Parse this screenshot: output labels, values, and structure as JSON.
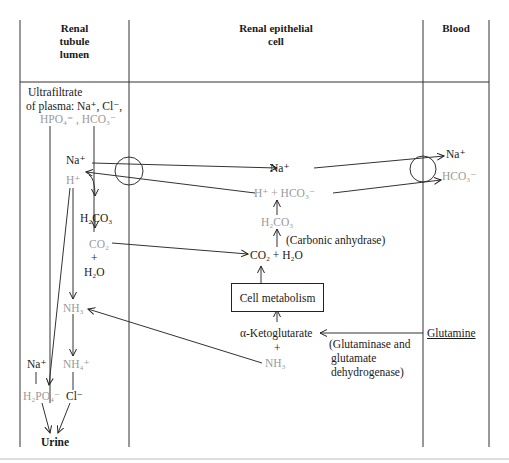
{
  "columns": {
    "lumen": {
      "line1": "Renal",
      "line2": "tubule",
      "line3": "lumen"
    },
    "cell": {
      "line1": "Renal epithelial",
      "line2": "cell"
    },
    "blood": {
      "line1": "Blood"
    }
  },
  "lumen": {
    "ultrafiltrate_line1": "Ultrafiltrate",
    "ultrafiltrate_line2": "of plasma: Na⁺, Cl⁻,",
    "ultrafiltrate_line3": "HPO₄⁼ , HCO₃⁻",
    "na": "Na⁺",
    "h": "H⁺",
    "h2co3": "H₂CO₃",
    "co2": "CO₂",
    "plus": "+",
    "h2o": "H₂O",
    "nh3": "NH₃",
    "na_lower": "Na⁺",
    "nh4": "NH₄⁺",
    "h2po4": "H₂PO₄⁻",
    "cl": "Cl⁻",
    "urine": "Urine"
  },
  "cell": {
    "na": "Na⁺",
    "h_hco3": "H⁺  + HCO₃⁻",
    "h2co3": "H₂CO₃",
    "enzyme_carbonic": "(Carbonic anhydrase)",
    "co2_h2o": "CO₂  + H₂O",
    "metabolism_box": "Cell metabolism",
    "ketoglutarate": "α-Ketoglutarate",
    "plus": "+",
    "nh3": "NH₃",
    "enzyme_glut_line1": "(Glutaminase and",
    "enzyme_glut_line2": "glutamate",
    "enzyme_glut_line3": "dehydrogenase)"
  },
  "blood": {
    "na": "Na⁺",
    "hco3": "HCO₃⁻",
    "glutamine": "Glutamine"
  },
  "colors": {
    "ink": "#1a1a1a",
    "gray_species": "#9a9a9a"
  }
}
